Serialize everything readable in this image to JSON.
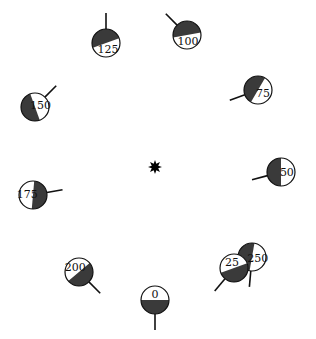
{
  "colors": {
    "background": "#ffffff",
    "dark_fill": "#3a3a3a",
    "light_fill": "#ffffff",
    "stroke": "#111111",
    "star": "#000000"
  },
  "center": {
    "name": "center-star",
    "x": 155,
    "y": 167
  },
  "dials": [
    {
      "label": "125",
      "cx": 106,
      "cy": 43,
      "r": 14,
      "split_deg": -20,
      "stick_deg": -90
    },
    {
      "label": "100",
      "cx": 187,
      "cy": 35,
      "r": 14,
      "split_deg": -10,
      "stick_deg": -135
    },
    {
      "label": "75",
      "cx": 258,
      "cy": 90,
      "r": 14,
      "split_deg": -60,
      "stick_deg": 160
    },
    {
      "label": "150",
      "cx": 35,
      "cy": 107,
      "r": 14,
      "split_deg": -110,
      "stick_deg": -45
    },
    {
      "label": "50",
      "cx": 281,
      "cy": 172,
      "r": 14,
      "split_deg": -90,
      "stick_deg": 165
    },
    {
      "label": "175",
      "cx": 33,
      "cy": 195,
      "r": 14,
      "split_deg": 95,
      "stick_deg": -10
    },
    {
      "label": "200",
      "cx": 79,
      "cy": 272,
      "r": 14,
      "split_deg": 140,
      "stick_deg": 45
    },
    {
      "label": "250",
      "cx": 252,
      "cy": 257,
      "r": 14,
      "split_deg": -80,
      "stick_deg": 95
    },
    {
      "label": "25",
      "cx": 234,
      "cy": 268,
      "r": 14,
      "split_deg": 160,
      "stick_deg": 130
    },
    {
      "label": "0",
      "cx": 155,
      "cy": 300,
      "r": 14,
      "split_deg": 180,
      "stick_deg": 90
    }
  ]
}
